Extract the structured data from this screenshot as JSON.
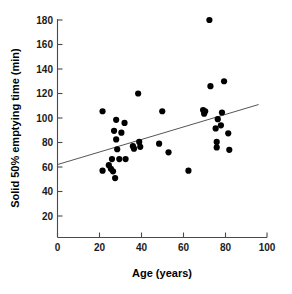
{
  "chart_data": {
    "type": "scatter",
    "title": "",
    "xlabel": "Age (years)",
    "ylabel": "Solid 50% emptying time (min)",
    "xlim": [
      0,
      100
    ],
    "ylim": [
      0,
      180
    ],
    "xticks": [
      0,
      20,
      40,
      60,
      80,
      100
    ],
    "yticks": [
      20,
      40,
      60,
      80,
      100,
      120,
      140,
      160,
      180
    ],
    "xtick_labels": [
      "0",
      "20",
      "40",
      "60",
      "80",
      "100"
    ],
    "ytick_labels": [
      "20",
      "40",
      "60",
      "80",
      "100",
      "120",
      "140",
      "160",
      "180"
    ],
    "grid": false,
    "legend": null,
    "marker": "filled-circle",
    "marker_color": "#000000",
    "points": [
      {
        "x": 21.5,
        "y": 105.5
      },
      {
        "x": 21.5,
        "y": 57.0
      },
      {
        "x": 24.5,
        "y": 61.5
      },
      {
        "x": 25.5,
        "y": 58.5
      },
      {
        "x": 26.0,
        "y": 66.5
      },
      {
        "x": 26.5,
        "y": 56.5
      },
      {
        "x": 27.0,
        "y": 89.5
      },
      {
        "x": 27.5,
        "y": 51.0
      },
      {
        "x": 28.0,
        "y": 98.5
      },
      {
        "x": 28.0,
        "y": 82.5
      },
      {
        "x": 28.5,
        "y": 74.5
      },
      {
        "x": 29.5,
        "y": 66.5
      },
      {
        "x": 30.5,
        "y": 88.0
      },
      {
        "x": 32.0,
        "y": 96.0
      },
      {
        "x": 32.5,
        "y": 66.5
      },
      {
        "x": 36.0,
        "y": 77.0
      },
      {
        "x": 36.5,
        "y": 75.0
      },
      {
        "x": 38.5,
        "y": 120.0
      },
      {
        "x": 39.0,
        "y": 80.5
      },
      {
        "x": 39.5,
        "y": 76.5
      },
      {
        "x": 48.5,
        "y": 79.0
      },
      {
        "x": 50.0,
        "y": 105.5
      },
      {
        "x": 53.0,
        "y": 72.0
      },
      {
        "x": 62.5,
        "y": 57.0
      },
      {
        "x": 69.5,
        "y": 106.5
      },
      {
        "x": 70.0,
        "y": 103.5
      },
      {
        "x": 70.5,
        "y": 105.5
      },
      {
        "x": 72.5,
        "y": 180.0
      },
      {
        "x": 73.0,
        "y": 126.0
      },
      {
        "x": 75.5,
        "y": 91.5
      },
      {
        "x": 76.0,
        "y": 80.5
      },
      {
        "x": 76.0,
        "y": 76.0
      },
      {
        "x": 76.5,
        "y": 99.0
      },
      {
        "x": 78.0,
        "y": 94.0
      },
      {
        "x": 78.5,
        "y": 104.5
      },
      {
        "x": 79.5,
        "y": 130.0
      },
      {
        "x": 81.5,
        "y": 87.5
      },
      {
        "x": 82.0,
        "y": 74.0
      }
    ],
    "trend_line": {
      "type": "linear-fit",
      "x_start": 0,
      "y_start": 62.0,
      "x_end": 96.0,
      "y_end": 111.0
    }
  }
}
